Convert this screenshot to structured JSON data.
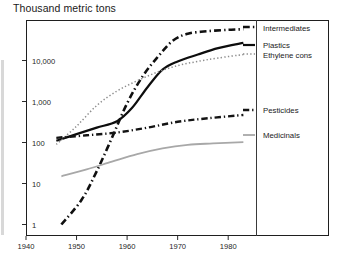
{
  "chart_data": {
    "type": "line",
    "title": "Thousand metric tons",
    "xlabel": "",
    "ylabel": "",
    "yscale": "log",
    "ylim": [
      1,
      100000
    ],
    "xlim": [
      1940,
      1985
    ],
    "grid": false,
    "legend_position": "right",
    "ytick_labels": [
      "1",
      "10",
      "100",
      "1,000",
      "10,000"
    ],
    "ytick_values": [
      1,
      10,
      100,
      1000,
      10000
    ],
    "xtick_labels": [
      "1940",
      "1950",
      "1960",
      "1970",
      "1980"
    ],
    "xtick_values": [
      1940,
      1950,
      1960,
      1970,
      1980
    ],
    "series": [
      {
        "name": "Intermediates",
        "style": "dash-dot",
        "color": "#101010",
        "width": 2.6,
        "x": [
          1947,
          1951,
          1954,
          1957,
          1960,
          1963,
          1966,
          1969,
          1972,
          1976,
          1980,
          1983
        ],
        "values": [
          1,
          4,
          20,
          130,
          900,
          4000,
          12000,
          30000,
          45000,
          52000,
          56000,
          58000
        ]
      },
      {
        "name": "Plastics",
        "style": "solid",
        "color": "#0d0d0d",
        "width": 2.2,
        "x": [
          1946,
          1950,
          1954,
          1958,
          1961,
          1964,
          1967,
          1970,
          1974,
          1978,
          1983
        ],
        "values": [
          110,
          160,
          230,
          330,
          700,
          2200,
          6000,
          9500,
          14000,
          20000,
          27000
        ]
      },
      {
        "name": "Ethylene cons",
        "style": "dotted",
        "color": "#8c8c8c",
        "width": 1.5,
        "x": [
          1946,
          1950,
          1954,
          1958,
          1962,
          1966,
          1970,
          1974,
          1978,
          1983
        ],
        "values": [
          90,
          250,
          800,
          1800,
          3200,
          5200,
          7500,
          9500,
          11500,
          14000
        ]
      },
      {
        "name": "Pesticides",
        "style": "dash-dot",
        "color": "#141414",
        "width": 2.4,
        "x": [
          1946,
          1952,
          1958,
          1964,
          1970,
          1976,
          1983
        ],
        "values": [
          130,
          150,
          175,
          230,
          320,
          390,
          470
        ]
      },
      {
        "name": "Medicinals",
        "style": "solid",
        "color": "#a8a8a8",
        "width": 1.8,
        "x": [
          1947,
          1952,
          1957,
          1962,
          1967,
          1972,
          1977,
          1983
        ],
        "values": [
          15,
          22,
          34,
          52,
          72,
          88,
          95,
          102
        ]
      }
    ],
    "legend_labels": [
      "Intermediates",
      "Plastics",
      "Ethylene cons",
      "Pesticides",
      "Medicinals"
    ]
  }
}
